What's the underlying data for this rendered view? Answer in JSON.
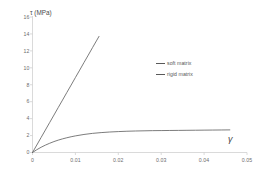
{
  "chart_data": {
    "type": "line",
    "title": "",
    "xlabel": "γ",
    "ylabel": "τ (MPa)",
    "xlim": [
      0,
      0.05
    ],
    "ylim": [
      0,
      16
    ],
    "grid": false,
    "legend_position": "upper-right",
    "x_ticks": [
      "0",
      "0.01",
      "0.02",
      "0.03",
      "0.04",
      "0.05"
    ],
    "x_tick_values": [
      0,
      0.01,
      0.02,
      0.03,
      0.04,
      0.05
    ],
    "y_ticks": [
      "0",
      "2",
      "4",
      "6",
      "8",
      "10",
      "12",
      "14",
      "16"
    ],
    "y_tick_values": [
      0,
      2,
      4,
      6,
      8,
      10,
      12,
      14,
      16
    ],
    "series": [
      {
        "name": "soft matrix",
        "color": "#5a5a5a",
        "points": [
          [
            0.0,
            0.0
          ],
          [
            0.001,
            0.88
          ],
          [
            0.002,
            1.77
          ],
          [
            0.003,
            2.65
          ],
          [
            0.004,
            3.54
          ],
          [
            0.005,
            4.42
          ],
          [
            0.006,
            5.31
          ],
          [
            0.007,
            6.19
          ],
          [
            0.008,
            7.08
          ],
          [
            0.009,
            7.96
          ],
          [
            0.01,
            8.85
          ],
          [
            0.011,
            9.73
          ],
          [
            0.012,
            10.62
          ],
          [
            0.013,
            11.5
          ],
          [
            0.014,
            12.39
          ],
          [
            0.015,
            13.27
          ],
          [
            0.0155,
            13.71
          ]
        ]
      },
      {
        "name": "rigid matrix",
        "color": "#5a5a5a",
        "points": [
          [
            0.0,
            0.0
          ],
          [
            0.001,
            0.33
          ],
          [
            0.002,
            0.62
          ],
          [
            0.003,
            0.87
          ],
          [
            0.004,
            1.09
          ],
          [
            0.005,
            1.29
          ],
          [
            0.006,
            1.46
          ],
          [
            0.007,
            1.61
          ],
          [
            0.008,
            1.74
          ],
          [
            0.009,
            1.86
          ],
          [
            0.01,
            1.96
          ],
          [
            0.012,
            2.13
          ],
          [
            0.014,
            2.26
          ],
          [
            0.016,
            2.35
          ],
          [
            0.018,
            2.42
          ],
          [
            0.02,
            2.47
          ],
          [
            0.022,
            2.51
          ],
          [
            0.024,
            2.54
          ],
          [
            0.026,
            2.56
          ],
          [
            0.028,
            2.58
          ],
          [
            0.03,
            2.59
          ],
          [
            0.032,
            2.6
          ],
          [
            0.034,
            2.61
          ],
          [
            0.036,
            2.62
          ],
          [
            0.038,
            2.63
          ],
          [
            0.04,
            2.64
          ],
          [
            0.042,
            2.65
          ],
          [
            0.044,
            2.66
          ],
          [
            0.046,
            2.67
          ]
        ]
      }
    ]
  },
  "legend": {
    "items": [
      {
        "label": "soft matrix"
      },
      {
        "label": "rigid matrix"
      }
    ]
  }
}
